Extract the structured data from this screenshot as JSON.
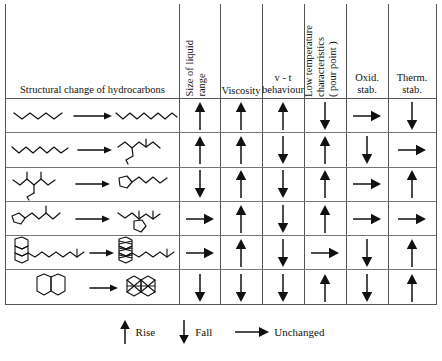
{
  "figure": {
    "kind": "table",
    "colors": {
      "rule": "#555555",
      "inner_rule": "#777777",
      "ink": "#111111",
      "background": "#ffffff"
    }
  },
  "table": {
    "columns": [
      {
        "id": "structural",
        "label": "Structural change of hydrocarbons",
        "orientation": "horizontal"
      },
      {
        "id": "liquid_range",
        "label": "Size of liquid range",
        "orientation": "vertical",
        "lines": [
          "Size of liquid",
          "range"
        ]
      },
      {
        "id": "viscosity",
        "label": "Viscosity",
        "orientation": "horizontal",
        "lines": [
          "Viscosity"
        ]
      },
      {
        "id": "vt_behaviour",
        "label": "v - t behaviour",
        "orientation": "horizontal",
        "lines": [
          "v - t",
          "behaviour"
        ]
      },
      {
        "id": "low_temp",
        "label": "Low temperature characteristics ( pour point )",
        "orientation": "vertical",
        "lines": [
          "Low temperature",
          "characteristics",
          "( pour point )"
        ]
      },
      {
        "id": "oxid_stab",
        "label": "Oxid. stab.",
        "orientation": "horizontal",
        "lines": [
          "Oxid.",
          "stab."
        ]
      },
      {
        "id": "therm_stab",
        "label": "Therm. stab.",
        "orientation": "horizontal",
        "lines": [
          "Therm.",
          "stab."
        ]
      }
    ],
    "rows": [
      {
        "id": "row-1",
        "structure_from": "short n-alkane (zig-zag, 4 units)",
        "structure_to": "long n-alkane (zig-zag, 10 units)",
        "cells": {
          "liquid_range": "rise",
          "viscosity": "rise",
          "vt_behaviour": "rise",
          "low_temp": "fall",
          "oxid_stab": "unchanged",
          "therm_stab": "fall"
        }
      },
      {
        "id": "row-2",
        "structure_from": "n-alkane (zig-zag, 7 units)",
        "structure_to": "branched iso-alkane",
        "cells": {
          "liquid_range": "rise",
          "viscosity": "rise",
          "vt_behaviour": "fall",
          "low_temp": "rise",
          "oxid_stab": "fall",
          "therm_stab": "unchanged"
        }
      },
      {
        "id": "row-3",
        "structure_from": "highly branched alkane",
        "structure_to": "cyclopentane ring with alkyl chain",
        "cells": {
          "liquid_range": "fall",
          "viscosity": "rise",
          "vt_behaviour": "fall",
          "low_temp": "rise",
          "oxid_stab": "unchanged",
          "therm_stab": "rise"
        }
      },
      {
        "id": "row-4",
        "structure_from": "cyclopentane ring with branched chain",
        "structure_to": "branched chain attached to ring",
        "cells": {
          "liquid_range": "unchanged",
          "viscosity": "rise",
          "vt_behaviour": "fall",
          "low_temp": "rise",
          "oxid_stab": "unchanged",
          "therm_stab": "unchanged"
        }
      },
      {
        "id": "row-5",
        "structure_from": "fused tricyclic naphthene with chain",
        "structure_to": "fused aromatic rings with chain",
        "cells": {
          "liquid_range": "unchanged",
          "viscosity": "rise",
          "vt_behaviour": "fall",
          "low_temp": "unchanged",
          "oxid_stab": "fall",
          "therm_stab": "rise"
        }
      },
      {
        "id": "row-6",
        "structure_from": "decalin (two fused saturated rings)",
        "structure_to": "naphthalene (two fused aromatic rings)",
        "cells": {
          "liquid_range": "fall",
          "viscosity": "fall",
          "vt_behaviour": "fall",
          "low_temp": "rise",
          "oxid_stab": "fall",
          "therm_stab": "rise"
        }
      }
    ]
  },
  "legend": {
    "items": [
      {
        "symbol": "rise",
        "label": "Rise"
      },
      {
        "symbol": "fall",
        "label": "Fall"
      },
      {
        "symbol": "unchanged",
        "label": "Unchanged"
      }
    ]
  }
}
